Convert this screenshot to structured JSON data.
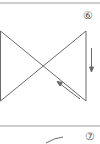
{
  "figures": [
    {
      "number": "⑥",
      "shape": "bowtie-cross",
      "arrows": [
        "arrow-down",
        "arrow-up-left"
      ]
    },
    {
      "number": "⑦",
      "shape": "curve-partial"
    }
  ],
  "colors": {
    "line": "#6a6a6a",
    "separator": "#9a9a9a",
    "background": "#ffffff"
  }
}
